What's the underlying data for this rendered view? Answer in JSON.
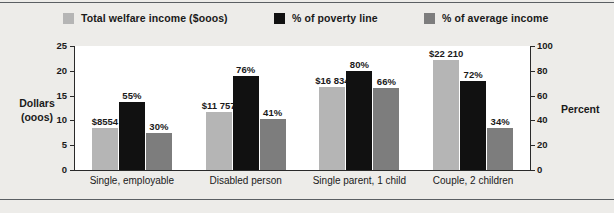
{
  "legend": [
    {
      "label": "Total welfare income ($ooos)",
      "color": "#b5b5b5",
      "icon": "legend-swatch"
    },
    {
      "label": "% of poverty line",
      "color": "#111111",
      "icon": "legend-swatch"
    },
    {
      "label": "% of average income",
      "color": "#7d7d7d",
      "icon": "legend-swatch"
    }
  ],
  "axes": {
    "left_title": "Dollars\n(ooos)",
    "right_title": "Percent",
    "left_ticks": [
      "25",
      "20",
      "15",
      "10",
      "5",
      "0"
    ],
    "right_ticks": [
      "100",
      "80",
      "60",
      "40",
      "20",
      "0"
    ]
  },
  "chart_data": {
    "type": "bar",
    "title": "",
    "xlabel": "",
    "ylabel": "Dollars (ooos)",
    "y2label": "Percent",
    "ylim": [
      0,
      25
    ],
    "y2lim": [
      0,
      100
    ],
    "grid": false,
    "legend_position": "top",
    "categories": [
      "Single, employable",
      "Disabled person",
      "Single parent, 1 child",
      "Couple, 2 children"
    ],
    "series": [
      {
        "name": "Total welfare income ($ooos)",
        "axis": "left",
        "color": "#b5b5b5",
        "values": [
          8.554,
          11.757,
          16.834,
          22.21
        ],
        "labels": [
          "$8554",
          "$11 757",
          "$16 834",
          "$22 210"
        ]
      },
      {
        "name": "% of poverty line",
        "axis": "right",
        "color": "#111111",
        "values": [
          55,
          76,
          80,
          72
        ],
        "labels": [
          "55%",
          "76%",
          "80%",
          "72%"
        ]
      },
      {
        "name": "% of average income",
        "axis": "right",
        "color": "#7d7d7d",
        "values": [
          30,
          41,
          66,
          34
        ],
        "labels": [
          "30%",
          "41%",
          "66%",
          "34%"
        ]
      }
    ]
  }
}
